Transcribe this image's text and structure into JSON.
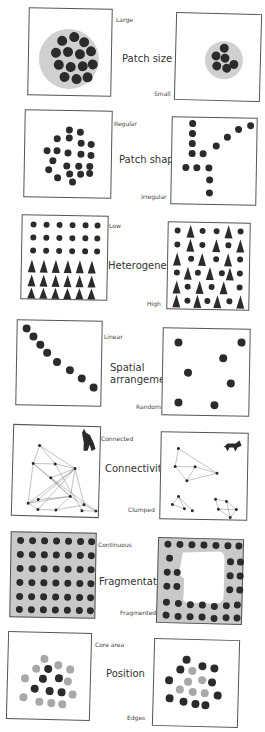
{
  "figure": {
    "panels": [
      {
        "id": "patch-size",
        "title": "Patch size",
        "left_label": "Large",
        "right_label": "Small"
      },
      {
        "id": "patch-shape",
        "title": "Patch shape",
        "left_label": "Regular",
        "right_label": "Irregular"
      },
      {
        "id": "heterogeneity",
        "title": "Heterogeneity",
        "left_label": "Low",
        "right_label": "High"
      },
      {
        "id": "spatial-arrangement",
        "title_line1": "Spatial",
        "title_line2": "arrangement",
        "left_label": "Linear",
        "right_label": "Random"
      },
      {
        "id": "connectivity",
        "title": "Connectivity",
        "left_label": "Connected",
        "right_label": "Clumped"
      },
      {
        "id": "fragmentation",
        "title": "Fragmentation",
        "left_label": "Continuous",
        "right_label": "Fragmented"
      },
      {
        "id": "position",
        "title": "Position",
        "left_label": "Core area",
        "right_label": "Edges"
      }
    ],
    "icons": {
      "tree": "deciduous-tree-icon",
      "conifer": "conifer-tree-icon",
      "wolf": "wolf-icon",
      "fox": "fox-icon"
    },
    "colors": {
      "tree_dark": "#2b2b2b",
      "tree_light": "#a8a8a8",
      "patch_fill": "#d0d0d0",
      "frame": "#555555"
    }
  }
}
